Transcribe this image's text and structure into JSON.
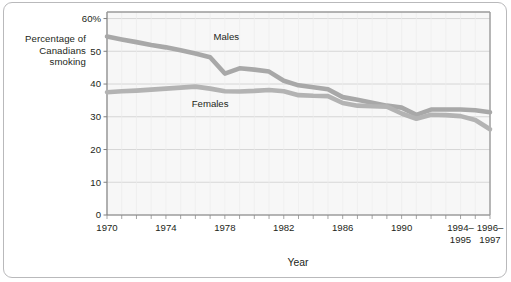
{
  "figure": {
    "y_axis_title_lines": [
      "Percentage of",
      "Canadians",
      "smoking"
    ],
    "x_axis_title": "Year"
  },
  "chart_data": {
    "type": "line",
    "title": "",
    "subtitle": "",
    "xlabel": "Year",
    "ylabel": "Percentage of Canadians smoking",
    "ylim": [
      0,
      62
    ],
    "xlim": [
      1970,
      1996
    ],
    "grid": true,
    "legend_position": "inline-annotation",
    "y_ticks": [
      0,
      10,
      20,
      30,
      40,
      50,
      60
    ],
    "y_tick_labels": [
      "0",
      "10",
      "20",
      "30",
      "40",
      "50",
      "60%"
    ],
    "x_ticks": [
      1970,
      1974,
      1978,
      1982,
      1986,
      1990,
      1994,
      1996
    ],
    "x_tick_labels": [
      "1970",
      "1974",
      "1978",
      "1982",
      "1986",
      "1990",
      "1994–1995",
      "1996–1997"
    ],
    "x": [
      1970,
      1971,
      1972,
      1973,
      1974,
      1975,
      1976,
      1977,
      1978,
      1979,
      1980,
      1981,
      1982,
      1983,
      1984,
      1985,
      1986,
      1987,
      1988,
      1989,
      1990,
      1991,
      1992,
      1993,
      1994,
      1995,
      1996
    ],
    "series": [
      {
        "name": "Males",
        "color": "#a8a8a8",
        "label_x": 1978.1,
        "label_y": 53.5,
        "values": [
          54.5,
          53.6,
          52.8,
          51.9,
          51.2,
          50.3,
          49.3,
          48.2,
          43.2,
          44.8,
          44.4,
          43.8,
          41.0,
          39.6,
          39.0,
          38.4,
          36.0,
          35.2,
          34.3,
          33.4,
          32.8,
          30.6,
          32.2,
          32.2,
          32.2,
          32.0,
          31.4
        ]
      },
      {
        "name": "Females",
        "color": "#b3b3b3",
        "label_x": 1977.0,
        "label_y": 33.0,
        "values": [
          37.5,
          37.8,
          38.0,
          38.3,
          38.6,
          38.9,
          39.2,
          38.6,
          37.8,
          37.7,
          37.9,
          38.2,
          37.8,
          36.6,
          36.4,
          36.3,
          34.2,
          33.4,
          33.2,
          33.1,
          31.0,
          29.4,
          30.6,
          30.5,
          30.2,
          29.0,
          26.2
        ]
      }
    ]
  }
}
